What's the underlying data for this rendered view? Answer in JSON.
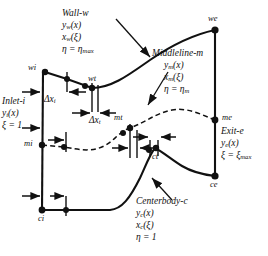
{
  "diagram": {
    "colors": {
      "line": "#111111",
      "background": "#ffffff",
      "node": "#111111"
    },
    "boundaries": {
      "wall": {
        "name": "Wall-w",
        "y_func": "yₒ(x)",
        "x_func": "xₒ(ξ)",
        "eta": "η = ηmax",
        "y_base": "y",
        "y_sub": "w",
        "x_base": "x",
        "x_sub": "w",
        "eta_base": "η = η",
        "eta_sub": "max"
      },
      "middleline": {
        "name": "Middleline-m",
        "y_base": "y",
        "y_sub": "m",
        "x_base": "x",
        "x_sub": "m",
        "eta_base": "η = η",
        "eta_sub": "m"
      },
      "centerbody": {
        "name": "Centerbody-c",
        "y_base": "y",
        "y_sub": "c",
        "x_base": "x",
        "x_sub": "c",
        "eta": "η = 1"
      },
      "inlet": {
        "name": "Inlet-i",
        "y_base": "y",
        "y_sub": "i",
        "xi": "ξ = 1"
      },
      "exit": {
        "name": "Exit-e",
        "y_base": "y",
        "y_sub": "e",
        "xi_base": "ξ = ξ",
        "xi_sub": "max"
      }
    },
    "nodes": [
      {
        "id": "wi",
        "label": "wi",
        "x": 45,
        "y": 72
      },
      {
        "id": "wt",
        "label": "wt",
        "x": 92,
        "y": 88
      },
      {
        "id": "we",
        "label": "we",
        "x": 215,
        "y": 30
      },
      {
        "id": "mi",
        "label": "mi",
        "x": 42,
        "y": 145
      },
      {
        "id": "mt",
        "label": "mt",
        "x": 130,
        "y": 128
      },
      {
        "id": "me",
        "label": "me",
        "x": 215,
        "y": 120
      },
      {
        "id": "ci",
        "label": "ci",
        "x": 42,
        "y": 210
      },
      {
        "id": "ct",
        "label": "ct",
        "x": 155,
        "y": 148
      },
      {
        "id": "ce",
        "label": "ce",
        "x": 215,
        "y": 176
      }
    ],
    "dimensions": [
      {
        "id": "dxi",
        "base": "Δx",
        "sub": "i"
      },
      {
        "id": "dxt",
        "base": "Δx",
        "sub": "t"
      }
    ]
  }
}
